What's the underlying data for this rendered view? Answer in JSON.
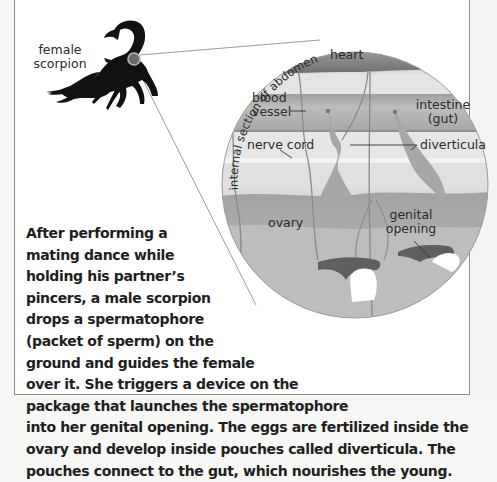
{
  "figure": {
    "scorpion_label": [
      "female",
      "scorpion"
    ],
    "section_label": "internal section of abdomen",
    "labels": {
      "heart": "heart",
      "blood_vessel": [
        "blood",
        "vessel"
      ],
      "intestine": [
        "intestine",
        "(gut)"
      ],
      "nerve_cord": "nerve cord",
      "diverticula": "diverticula",
      "ovary": "ovary",
      "genital_opening": [
        "genital",
        "opening"
      ]
    },
    "colors": {
      "tissue_gray": "#b9b9b9",
      "dark_gray": "#6e6e6e",
      "light_band": "#e3e3e3",
      "scorpion": "#111111",
      "highlight_ring": "#9c9c9c"
    }
  },
  "caption": {
    "lines": [
      "After performing a",
      "mating dance while",
      "holding his partner’s",
      "pincers, a male scorpion",
      "drops a spermatophore",
      "(packet of sperm) on the",
      "ground and guides the female",
      "over it. She triggers a device on the",
      "package that launches the spermatophore",
      "into her genital opening. The eggs are fertilized inside the",
      "ovary and develop inside pouches called diverticula. The",
      "pouches connect to the gut, which nourishes the young."
    ]
  }
}
